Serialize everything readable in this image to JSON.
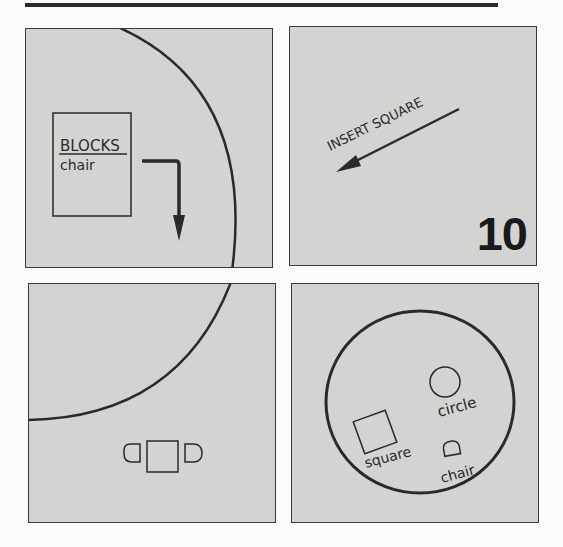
{
  "figure": {
    "step_number": "10",
    "panels": [
      {
        "id": "top-left",
        "dialog": {
          "title": "BLOCKS",
          "item": "chair"
        },
        "arrow": "bent-arrow-down"
      },
      {
        "id": "top-right",
        "instruction": "INSERT SQUARE",
        "arrow": "diagonal-arrow-down-left"
      },
      {
        "id": "bottom-left",
        "symbol": "table-with-two-chairs"
      },
      {
        "id": "bottom-right",
        "library_items": [
          {
            "name": "square",
            "label": "square"
          },
          {
            "name": "circle",
            "label": "circle"
          },
          {
            "name": "chair",
            "label": "chair"
          }
        ]
      }
    ]
  },
  "colors": {
    "panel_fill": "#d3d3d2",
    "page_bg": "#fbfbfa",
    "ink": "#2a2a2a"
  }
}
